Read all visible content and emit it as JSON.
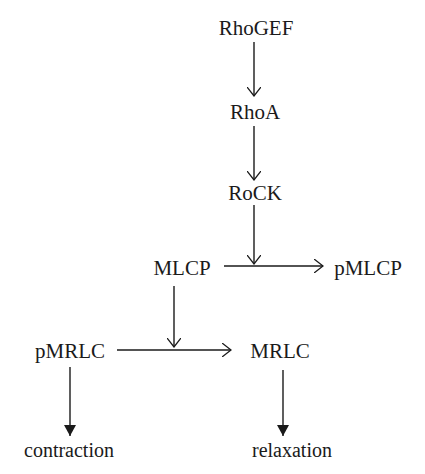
{
  "diagram": {
    "type": "signaling-pathway",
    "colors": {
      "text": "#1a1a1a",
      "line": "#1a1a1a",
      "background": "#ffffff"
    },
    "nodes": {
      "rhogef": "RhoGEF",
      "rhoa": "RhoA",
      "rock": "RoCK",
      "mlcp": "MLCP",
      "pmlcp": "pMLCP",
      "pmrlc": "pMRLC",
      "mrlc": "MRLC",
      "contraction": "contraction",
      "relaxation": "relaxation"
    },
    "edges": [
      {
        "from": "RhoGEF",
        "to": "RhoA",
        "style": "open-arrow"
      },
      {
        "from": "RhoA",
        "to": "RoCK",
        "style": "open-arrow"
      },
      {
        "from": "RoCK",
        "to": "MLCP->pMLCP",
        "style": "open-arrow",
        "note": "acts on the MLCP to pMLCP conversion"
      },
      {
        "from": "MLCP",
        "to": "pMLCP",
        "style": "open-arrow"
      },
      {
        "from": "MLCP",
        "to": "pMRLC->MRLC",
        "style": "open-arrow",
        "note": "acts on the pMRLC to MRLC conversion"
      },
      {
        "from": "pMRLC",
        "to": "MRLC",
        "style": "open-arrow"
      },
      {
        "from": "pMRLC",
        "to": "contraction",
        "style": "filled-arrow"
      },
      {
        "from": "MRLC",
        "to": "relaxation",
        "style": "filled-arrow"
      }
    ]
  }
}
